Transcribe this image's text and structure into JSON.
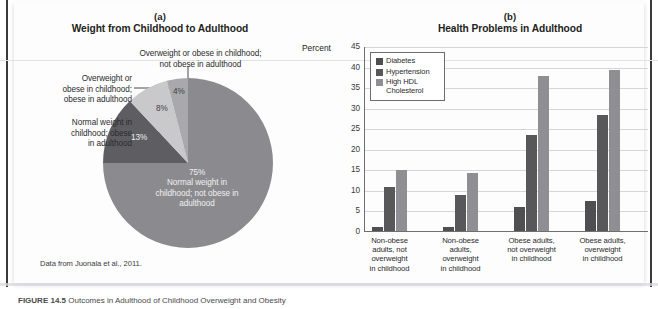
{
  "figure": {
    "panel_a": {
      "letter": "(a)",
      "title": "Weight from Childhood to Adulthood",
      "source_note": "Data from Juonala et al., 2011."
    },
    "panel_b": {
      "letter": "(b)",
      "title": "Health Problems in Adulthood",
      "y_axis_label": "Percent"
    },
    "caption_number": "FIGURE 14.5",
    "caption_text": "  Outcomes in Adulthood of Childhood Overweight and Obesity"
  },
  "pie_labels": {
    "overweight_not_obese": "Overweight or obese in childhood;\nnot obese in adulthood",
    "overweight_obese": "Overweight or\nobese in childhood;\nobese in adulthood",
    "normal_obese": "Normal weight in\nchildhood; obese\nin adulthood",
    "normal_not_obese_value": "75%",
    "normal_not_obese_text": "Normal weight in\nchildhood; not obese in\nadulthood",
    "pct_13": "13%",
    "pct_8": "8%",
    "pct_4": "4%"
  },
  "legend": {
    "items": [
      {
        "label": "Diabetes",
        "color": "#4f4f52"
      },
      {
        "label": "Hypertension",
        "color": "#58585b"
      },
      {
        "label": "High HDL\nCholesterol",
        "color": "#8f8f93"
      }
    ]
  },
  "colors": {
    "slice_75": "#8b8b8f",
    "slice_13": "#5e5e62",
    "slice_8": "#c9c9cc",
    "slice_4": "#a9a9ad",
    "diabetes": "#4f4f52",
    "hypertension": "#58585b",
    "hdl": "#8f8f93",
    "gridline": "#d6d6d8",
    "axis": "#6f6f72"
  },
  "chart_data": [
    {
      "type": "pie",
      "title": "Weight from Childhood to Adulthood",
      "labels": [
        "Normal weight in childhood; not obese in adulthood",
        "Normal weight in childhood; obese in adulthood",
        "Overweight or obese in childhood; obese in adulthood",
        "Overweight or obese in childhood; not obese in adulthood"
      ],
      "values": [
        75,
        13,
        8,
        4
      ],
      "value_labels": [
        "75%",
        "13%",
        "8%",
        "4%"
      ],
      "colors": [
        "#8b8b8f",
        "#5e5e62",
        "#c9c9cc",
        "#a9a9ad"
      ],
      "start_angle_deg": 0,
      "direction": "clockwise",
      "legend": "none",
      "annotation": "Data from Juonala et al., 2011."
    },
    {
      "type": "bar",
      "title": "Health Problems in Adulthood",
      "xlabel": "",
      "ylabel": "Percent",
      "ylim": [
        0,
        45
      ],
      "yticks": [
        0,
        5,
        10,
        15,
        20,
        25,
        30,
        35,
        40,
        45
      ],
      "grid": true,
      "legend_position": "upper-left-inside",
      "categories": [
        "Non-obese adults, not overweight in childhood",
        "Non-obese adults, overweight in childhood",
        "Obese adults, not overweight in childhood",
        "Obese adults, overweight in childhood"
      ],
      "category_lines": [
        [
          "Non-obese",
          "adults, not",
          "overweight",
          "in childhood"
        ],
        [
          "Non-obese",
          "adults,",
          "overweight",
          "in childhood"
        ],
        [
          "Obese adults,",
          "not overweight",
          "in childhood"
        ],
        [
          "Obese adults,",
          "overweight",
          "in childhood"
        ]
      ],
      "series": [
        {
          "name": "Diabetes",
          "values": [
            1.2,
            1.2,
            6.0,
            7.5
          ],
          "color": "#4f4f52"
        },
        {
          "name": "Hypertension",
          "values": [
            11.0,
            9.0,
            23.7,
            28.5
          ],
          "color": "#58585b"
        },
        {
          "name": "High HDL Cholesterol",
          "values": [
            15.0,
            14.3,
            38.0,
            39.3
          ],
          "color": "#8f8f93"
        }
      ]
    }
  ]
}
